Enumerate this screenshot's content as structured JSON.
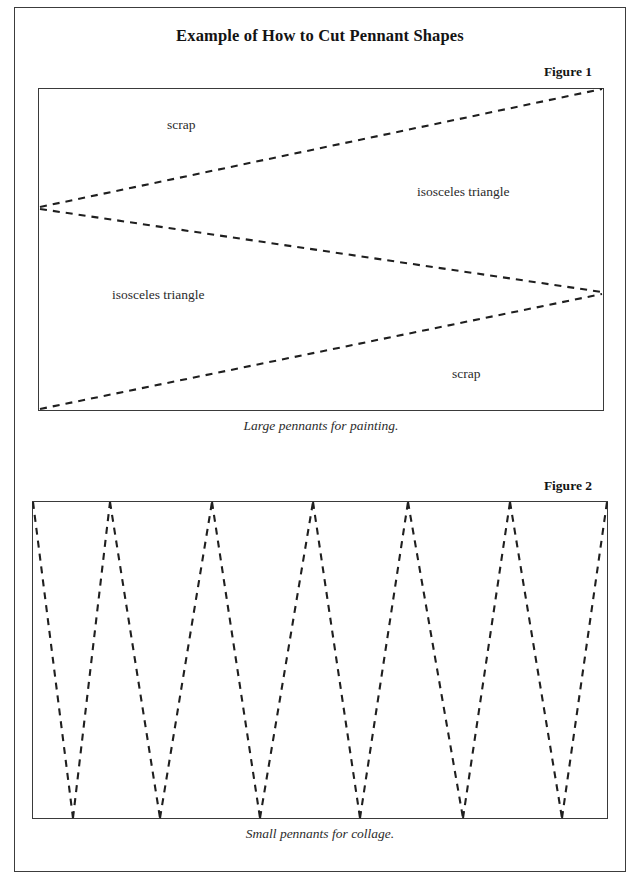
{
  "page": {
    "title": "Example of How to Cut Pennant Shapes",
    "border_color": "#3c3c3c",
    "background_color": "#ffffff",
    "width": 640,
    "height": 889
  },
  "figures": [
    {
      "label": "Figure 1",
      "caption": "Large pennants for painting.",
      "box": {
        "x": 38,
        "y": 88,
        "width": 566,
        "height": 323
      },
      "description": "Large rectangle of paper marked with dashed cut lines forming two large isosceles triangles and two scrap regions.",
      "cut_lines_style": "dashed",
      "labels": [
        {
          "text": "scrap",
          "x": 167,
          "y": 117,
          "name": "label-scrap-top"
        },
        {
          "text": "isosceles triangle",
          "x": 417,
          "y": 184,
          "name": "label-iso-right"
        },
        {
          "text": "isosceles triangle",
          "x": 112,
          "y": 287,
          "name": "label-iso-left"
        },
        {
          "text": "scrap",
          "x": 452,
          "y": 366,
          "name": "label-scrap-bottom"
        }
      ],
      "vertices": {
        "left_apex": {
          "x": 0,
          "y": 119
        },
        "right_apex": {
          "x": 565,
          "y": 204
        },
        "top_right_corner": {
          "x": 565,
          "y": 0
        },
        "bottom_left_corner": {
          "x": 0,
          "y": 322
        }
      }
    },
    {
      "label": "Figure 2",
      "caption": "Small pennants for collage.",
      "box": {
        "x": 32,
        "y": 501,
        "width": 576,
        "height": 318
      },
      "description": "Long rectangle of paper marked with dashed zigzag cut lines forming a row of narrow isosceles triangle pennants.",
      "cut_lines_style": "dashed",
      "top_vertices_x": [
        1,
        78,
        180,
        281,
        376,
        478,
        575
      ],
      "bottom_vertices_x": [
        41,
        128,
        228,
        328,
        431,
        530
      ],
      "pennant_count": 12
    }
  ],
  "chart_data": {
    "type": "diagram",
    "title": "Example of How to Cut Pennant Shapes",
    "panels": [
      {
        "name": "Figure 1",
        "caption": "Large pennants for painting.",
        "regions": [
          "scrap",
          "isosceles triangle",
          "isosceles triangle",
          "scrap"
        ],
        "triangle_count": 2
      },
      {
        "name": "Figure 2",
        "caption": "Small pennants for collage.",
        "triangle_count": 12,
        "top_vertex_count": 7,
        "bottom_vertex_count": 6
      }
    ]
  }
}
